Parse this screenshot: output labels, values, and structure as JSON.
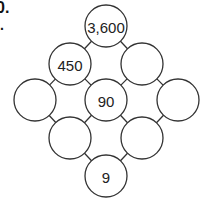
{
  "question": {
    "number_fragment": "0.",
    "mark": "."
  },
  "diagram": {
    "stroke_color": "#333333",
    "radius": 21,
    "nodes": [
      {
        "id": "top",
        "cx": 106,
        "cy": 26,
        "value": "3,600"
      },
      {
        "id": "upper-left",
        "cx": 70,
        "cy": 64,
        "value": "450"
      },
      {
        "id": "upper-right",
        "cx": 142,
        "cy": 64,
        "value": ""
      },
      {
        "id": "mid-left",
        "cx": 35,
        "cy": 100,
        "value": ""
      },
      {
        "id": "center",
        "cx": 106,
        "cy": 100,
        "value": "90"
      },
      {
        "id": "mid-right",
        "cx": 178,
        "cy": 100,
        "value": ""
      },
      {
        "id": "lower-left",
        "cx": 70,
        "cy": 138,
        "value": ""
      },
      {
        "id": "lower-right",
        "cx": 142,
        "cy": 138,
        "value": ""
      },
      {
        "id": "bottom",
        "cx": 106,
        "cy": 176,
        "value": "9"
      }
    ],
    "edges": [
      [
        "top",
        "upper-left"
      ],
      [
        "top",
        "upper-right"
      ],
      [
        "upper-left",
        "mid-left"
      ],
      [
        "upper-left",
        "center"
      ],
      [
        "upper-right",
        "center"
      ],
      [
        "upper-right",
        "mid-right"
      ],
      [
        "mid-left",
        "lower-left"
      ],
      [
        "center",
        "lower-left"
      ],
      [
        "center",
        "lower-right"
      ],
      [
        "mid-right",
        "lower-right"
      ],
      [
        "lower-left",
        "bottom"
      ],
      [
        "lower-right",
        "bottom"
      ]
    ]
  }
}
